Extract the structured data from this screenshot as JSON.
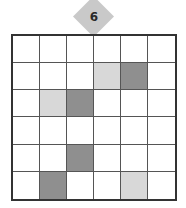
{
  "badge": {
    "number": "6",
    "color": "#c9c9c9"
  },
  "grid": {
    "rows": 6,
    "cols": 6,
    "colors": {
      "empty": "#ffffff",
      "light": "#d8d8d8",
      "dark": "#8f8f8f"
    },
    "cells": [
      [
        "empty",
        "empty",
        "empty",
        "empty",
        "empty",
        "empty"
      ],
      [
        "empty",
        "empty",
        "empty",
        "light",
        "dark",
        "empty"
      ],
      [
        "empty",
        "light",
        "dark",
        "empty",
        "empty",
        "empty"
      ],
      [
        "empty",
        "empty",
        "empty",
        "empty",
        "empty",
        "empty"
      ],
      [
        "empty",
        "empty",
        "dark",
        "empty",
        "empty",
        "empty"
      ],
      [
        "empty",
        "dark",
        "empty",
        "empty",
        "light",
        "empty"
      ]
    ]
  }
}
